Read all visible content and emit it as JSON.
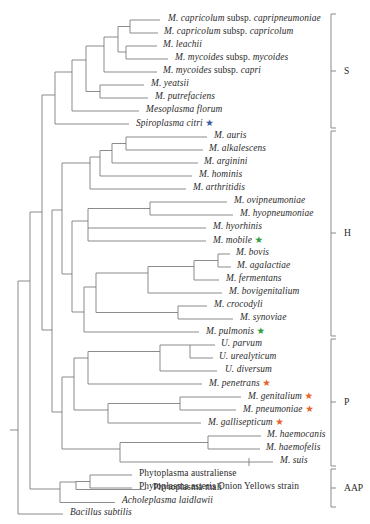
{
  "figure": {
    "line_color": "#77777a",
    "text_color": "#2b2b2b",
    "star_colors": {
      "blue": "#3a5ba0",
      "green": "#2f9e41",
      "orange": "#e8642a"
    }
  },
  "taxa": [
    {
      "id": "m-capricolum-capripneumoniae",
      "genus": "M. capricolum",
      "connector": "subsp.",
      "epithet": "capripneumoniae",
      "star": null,
      "x": 168,
      "y": 20,
      "tip_x": 160
    },
    {
      "id": "m-capricolum-capricolum",
      "genus": "M. capricolum",
      "connector": "subsp.",
      "epithet": "capricolum",
      "star": null,
      "x": 164,
      "y": 33,
      "tip_x": 158
    },
    {
      "id": "m-leachii",
      "genus": "M. leachii",
      "connector": null,
      "epithet": null,
      "star": null,
      "x": 163,
      "y": 46,
      "tip_x": 157
    },
    {
      "id": "m-mycoides-mycoides",
      "genus": "M. mycoides",
      "connector": "subsp.",
      "epithet": "mycoides",
      "star": null,
      "x": 175,
      "y": 59,
      "tip_x": 168
    },
    {
      "id": "m-mycoides-capri",
      "genus": "M. mycoides",
      "connector": "subsp.",
      "epithet": "capri",
      "star": null,
      "x": 163,
      "y": 72,
      "tip_x": 157
    },
    {
      "id": "m-yeatsii",
      "genus": "M. yeatsii",
      "connector": null,
      "epithet": null,
      "star": null,
      "x": 151,
      "y": 85,
      "tip_x": 144
    },
    {
      "id": "m-putrefaciens",
      "genus": "M. putrefaciens",
      "connector": null,
      "epithet": null,
      "star": null,
      "x": 155,
      "y": 98,
      "tip_x": 148
    },
    {
      "id": "mesoplasma-florum",
      "genus": "Mesoplasma florum",
      "connector": null,
      "epithet": null,
      "star": null,
      "x": 146,
      "y": 111,
      "tip_x": 139
    },
    {
      "id": "spiroplasma-citri",
      "genus": "Spiroplasma citri",
      "connector": null,
      "epithet": null,
      "star": "blue",
      "x": 136,
      "y": 124,
      "tip_x": 129
    },
    {
      "id": "m-auris",
      "genus": "M. auris",
      "connector": null,
      "epithet": null,
      "star": null,
      "x": 214,
      "y": 137,
      "tip_x": 207
    },
    {
      "id": "m-alkalescens",
      "genus": "M. alkalescens",
      "connector": null,
      "epithet": null,
      "star": null,
      "x": 209,
      "y": 150,
      "tip_x": 203
    },
    {
      "id": "m-arginini",
      "genus": "M. arginini",
      "connector": null,
      "epithet": null,
      "star": null,
      "x": 204,
      "y": 163,
      "tip_x": 198
    },
    {
      "id": "m-hominis",
      "genus": "M. hominis",
      "connector": null,
      "epithet": null,
      "star": null,
      "x": 199,
      "y": 176,
      "tip_x": 192
    },
    {
      "id": "m-arthritidis",
      "genus": "M. arthritidis",
      "connector": null,
      "epithet": null,
      "star": null,
      "x": 193,
      "y": 189,
      "tip_x": 186
    },
    {
      "id": "m-ovipneumoniae",
      "genus": "M. ovipneumoniae",
      "connector": null,
      "epithet": null,
      "star": null,
      "x": 234,
      "y": 202,
      "tip_x": 227
    },
    {
      "id": "m-hyopneumoniae",
      "genus": "M. hyopneumoniae",
      "connector": null,
      "epithet": null,
      "star": null,
      "x": 240,
      "y": 215,
      "tip_x": 233
    },
    {
      "id": "m-hyorhinis",
      "genus": "M. hyorhinis",
      "connector": null,
      "epithet": null,
      "star": null,
      "x": 213,
      "y": 228,
      "tip_x": 206
    },
    {
      "id": "m-mobile",
      "genus": "M. mobile",
      "connector": null,
      "epithet": null,
      "star": "green",
      "x": 213,
      "y": 241,
      "tip_x": 206
    },
    {
      "id": "m-bovis",
      "genus": "M. bovis",
      "connector": null,
      "epithet": null,
      "star": null,
      "x": 236,
      "y": 254,
      "tip_x": 230
    },
    {
      "id": "m-agalactiae",
      "genus": "M. agalactiae",
      "connector": null,
      "epithet": null,
      "star": null,
      "x": 237,
      "y": 267,
      "tip_x": 231
    },
    {
      "id": "m-fermentans",
      "genus": "M. fermentans",
      "connector": null,
      "epithet": null,
      "star": null,
      "x": 226,
      "y": 280,
      "tip_x": 219
    },
    {
      "id": "m-bovigenitalium",
      "genus": "M. bovigenitalium",
      "connector": null,
      "epithet": null,
      "star": null,
      "x": 229,
      "y": 293,
      "tip_x": 222
    },
    {
      "id": "m-crocodyli",
      "genus": "M. crocodyli",
      "connector": null,
      "epithet": null,
      "star": null,
      "x": 214,
      "y": 306,
      "tip_x": 207
    },
    {
      "id": "m-synoviae",
      "genus": "M. synoviae",
      "connector": null,
      "epithet": null,
      "star": null,
      "x": 240,
      "y": 319,
      "tip_x": 233
    },
    {
      "id": "m-pulmonis",
      "genus": "M. pulmonis",
      "connector": null,
      "epithet": null,
      "star": "green",
      "x": 206,
      "y": 332,
      "tip_x": 199
    },
    {
      "id": "u-parvum",
      "genus": "U. parvum",
      "connector": null,
      "epithet": null,
      "star": null,
      "x": 221,
      "y": 345,
      "tip_x": 215
    },
    {
      "id": "u-urealyticum",
      "genus": "U. urealyticum",
      "connector": null,
      "epithet": null,
      "star": null,
      "x": 219,
      "y": 358,
      "tip_x": 213
    },
    {
      "id": "u-diversum",
      "genus": "U. diversum",
      "connector": null,
      "epithet": null,
      "star": null,
      "x": 225,
      "y": 371,
      "tip_x": 217
    },
    {
      "id": "m-penetrans",
      "genus": "M. penetrans",
      "connector": null,
      "epithet": null,
      "star": "orange",
      "x": 209,
      "y": 384,
      "tip_x": 202
    },
    {
      "id": "m-genitalium",
      "genus": "M. genitalium",
      "connector": null,
      "epithet": null,
      "star": "orange",
      "x": 248,
      "y": 397,
      "tip_x": 241
    },
    {
      "id": "m-pneumoniae",
      "genus": "M. pneumoniae",
      "connector": null,
      "epithet": null,
      "star": "orange",
      "x": 243,
      "y": 410,
      "tip_x": 236
    },
    {
      "id": "m-gallisepticum",
      "genus": "M. gallisepticum",
      "connector": null,
      "epithet": null,
      "star": "orange",
      "x": 208,
      "y": 423,
      "tip_x": 201
    },
    {
      "id": "m-haemocanis",
      "genus": "M. haemocanis",
      "connector": null,
      "epithet": null,
      "star": null,
      "x": 267,
      "y": 436,
      "tip_x": 261
    },
    {
      "id": "m-haemofelis",
      "genus": "M. haemofelis",
      "connector": null,
      "epithet": null,
      "star": null,
      "x": 266,
      "y": 449,
      "tip_x": 260
    },
    {
      "id": "m-suis",
      "genus": "M. suis",
      "connector": null,
      "epithet": null,
      "star": null,
      "x": 280,
      "y": 462,
      "tip_x": 273
    },
    {
      "id": "phytoplasma-australiense",
      "genus": "Phytoplasma australiense",
      "connector": null,
      "epithet": null,
      "star": null,
      "x": 139,
      "y": 475,
      "tip_x": 132,
      "italic": false
    },
    {
      "id": "phytoplasma-asteris",
      "genus": "Phytoplasma asteris Onion Yellows strain",
      "connector": null,
      "epithet": null,
      "star": null,
      "x": 139,
      "y": 488,
      "tip_x": 132,
      "italic": false
    },
    {
      "id": "phytoplasma-mali",
      "genus": "Phytoplasma mali",
      "connector": null,
      "epithet": null,
      "star": null,
      "x": 153,
      "y": 489.5,
      "tip_x": 146,
      "italic": false
    },
    {
      "id": "acholeplasma-laidlawii",
      "genus": "Acholeplasma laidlawii",
      "connector": null,
      "epithet": null,
      "star": null,
      "x": 122,
      "y": 502.5,
      "tip_x": 115
    },
    {
      "id": "bacillus-subtilis",
      "genus": "Bacillus subtilis",
      "connector": null,
      "epithet": null,
      "star": null,
      "x": 70,
      "y": 514,
      "tip_x": 63
    }
  ],
  "groups": [
    {
      "id": "group-s",
      "label": "S",
      "top": 14,
      "bottom": 128,
      "label_y": 71
    },
    {
      "id": "group-h",
      "label": "H",
      "top": 131,
      "bottom": 336,
      "label_y": 233
    },
    {
      "id": "group-p",
      "label": "P",
      "top": 339,
      "bottom": 466,
      "label_y": 402
    },
    {
      "id": "group-aap",
      "label": "AAP",
      "top": 469,
      "bottom": 507,
      "label_y": 488
    }
  ],
  "star_glyph": "★",
  "bracket": {
    "x": 331,
    "tick_length": 5,
    "label_x": 344
  }
}
